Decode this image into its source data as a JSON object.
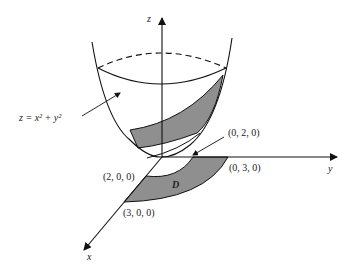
{
  "figure": {
    "axes": {
      "z_label": "z",
      "y_label": "y",
      "x_label": "x"
    },
    "surface_label": "z = x² + y²",
    "region_label": "D",
    "points": [
      {
        "name": "p020",
        "label": "(0, 2, 0)"
      },
      {
        "name": "p030",
        "label": "(0, 3, 0)"
      },
      {
        "name": "p200",
        "label": "(2, 0, 0)"
      },
      {
        "name": "p300",
        "label": "(3, 0, 0)"
      }
    ],
    "colors": {
      "line": "#111111",
      "shade": "#8f8f8f"
    }
  }
}
